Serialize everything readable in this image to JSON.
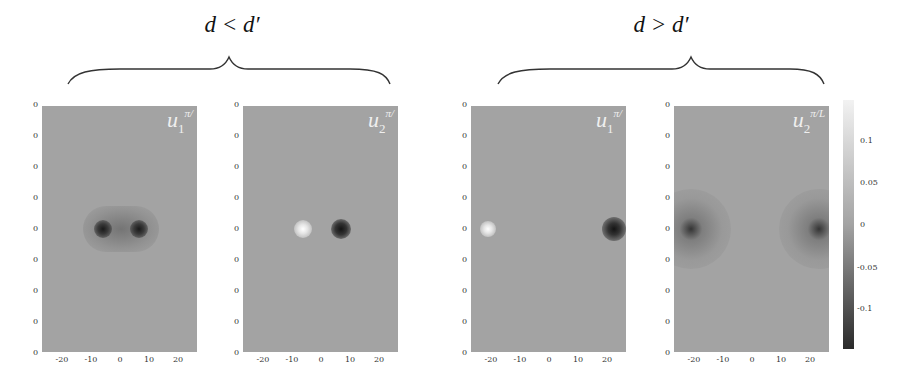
{
  "chart_data": {
    "type": "heatmap",
    "title": "",
    "groups": [
      {
        "label": "d < d'",
        "panels": [
          0,
          1
        ]
      },
      {
        "label": "d > d'",
        "panels": [
          2,
          3
        ]
      }
    ],
    "panels": [
      {
        "label": "u_1^{π/L}",
        "label_main": "u",
        "label_sub": "1",
        "label_sup": "π/",
        "xticks": [
          "-20",
          "-10",
          "0",
          "10",
          "20"
        ],
        "yticks": [
          "0",
          "0",
          "0",
          "0",
          "0",
          "0",
          "0",
          "0",
          "0"
        ],
        "features": [
          {
            "x": -6,
            "sign": "negative",
            "value": -0.14
          },
          {
            "x": 6,
            "sign": "negative",
            "value": -0.14
          }
        ]
      },
      {
        "label": "u_2^{π/L}",
        "label_main": "u",
        "label_sub": "2",
        "label_sup": "π/",
        "xticks": [
          "-20",
          "-10",
          "0",
          "10",
          "20"
        ],
        "yticks": [
          "0",
          "0",
          "0",
          "0",
          "0",
          "0",
          "0",
          "0",
          "0"
        ],
        "features": [
          {
            "x": -6,
            "sign": "positive",
            "value": 0.14
          },
          {
            "x": 6,
            "sign": "negative",
            "value": -0.14
          }
        ]
      },
      {
        "label": "u_1^{π/L}",
        "label_main": "u",
        "label_sub": "1",
        "label_sup": "π/",
        "xticks": [
          "-20",
          "-10",
          "0",
          "10",
          "20"
        ],
        "yticks": [
          "0",
          "0",
          "0",
          "0",
          "0",
          "0",
          "0",
          "0",
          "0"
        ],
        "features": [
          {
            "x": -21,
            "sign": "positive",
            "value": 0.14
          },
          {
            "x": 21,
            "sign": "negative",
            "value": -0.14
          }
        ]
      },
      {
        "label": "u_2^{π/L}",
        "label_main": "u",
        "label_sub": "2",
        "label_sup": "π/L",
        "xticks": [
          "-20",
          "-10",
          "0",
          "10",
          "20"
        ],
        "yticks": [
          "0",
          "0",
          "0",
          "0",
          "0",
          "0",
          "0",
          "0",
          "0"
        ],
        "features": [
          {
            "x": -21,
            "sign": "negative",
            "value": -0.14
          },
          {
            "x": 21,
            "sign": "negative",
            "value": -0.14
          }
        ]
      }
    ],
    "xlim": [
      -27,
      27
    ],
    "colorbar": {
      "ticks": [
        "0.1",
        "0.05",
        "0",
        "-0.05",
        "-0.1"
      ],
      "range": [
        -0.14,
        0.14
      ],
      "colormap": "gray"
    },
    "xlabel": "",
    "ylabel": ""
  },
  "header": {
    "left_group_label": "d < d′",
    "right_group_label": "d > d′"
  }
}
